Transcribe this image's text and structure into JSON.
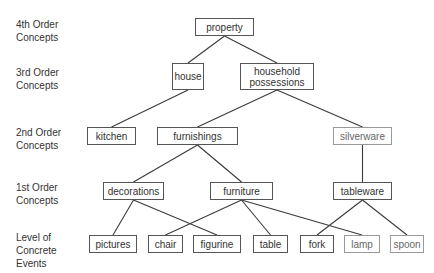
{
  "levels": [
    {
      "id": "L4",
      "label": "4th Order\nConcepts",
      "top": 18
    },
    {
      "id": "L3",
      "label": "3rd Order\nConcepts",
      "top": 66
    },
    {
      "id": "L2",
      "label": "2nd Order\nConcepts",
      "top": 126
    },
    {
      "id": "L1",
      "label": "1st Order\nConcepts",
      "top": 181
    },
    {
      "id": "L0",
      "label": "Level of\nConcrete\nEvents",
      "top": 231
    }
  ],
  "nodes": {
    "property": {
      "label": "property",
      "x": 195,
      "y": 18,
      "w": 59,
      "h": 18
    },
    "house": {
      "label": "house",
      "x": 172,
      "y": 63,
      "w": 32,
      "h": 27
    },
    "household_possessions": {
      "label": "household\npossessions",
      "x": 240,
      "y": 63,
      "w": 74,
      "h": 27
    },
    "kitchen": {
      "label": "kitchen",
      "x": 87,
      "y": 127,
      "w": 49,
      "h": 18
    },
    "furnishings": {
      "label": "furnishings",
      "x": 157,
      "y": 127,
      "w": 81,
      "h": 18
    },
    "silverware": {
      "label": "silverware",
      "x": 333,
      "y": 127,
      "w": 59,
      "h": 18
    },
    "decorations": {
      "label": "decorations",
      "x": 103,
      "y": 182,
      "w": 61,
      "h": 18
    },
    "furniture": {
      "label": "furniture",
      "x": 210,
      "y": 182,
      "w": 63,
      "h": 18
    },
    "tableware": {
      "label": "tableware",
      "x": 333,
      "y": 182,
      "w": 59,
      "h": 18
    },
    "pictures": {
      "label": "pictures",
      "x": 89,
      "y": 235,
      "w": 48,
      "h": 18
    },
    "chair": {
      "label": "chair",
      "x": 148,
      "y": 235,
      "w": 35,
      "h": 18
    },
    "figurine": {
      "label": "figurine",
      "x": 193,
      "y": 235,
      "w": 48,
      "h": 18
    },
    "table": {
      "label": "table",
      "x": 253,
      "y": 235,
      "w": 35,
      "h": 18
    },
    "fork": {
      "label": "fork",
      "x": 300,
      "y": 235,
      "w": 34,
      "h": 18
    },
    "lamp": {
      "label": "lamp",
      "x": 344,
      "y": 235,
      "w": 36,
      "h": 18
    },
    "spoon": {
      "label": "spoon",
      "x": 390,
      "y": 235,
      "w": 34,
      "h": 18
    }
  },
  "edges": [
    [
      "property",
      "house"
    ],
    [
      "property",
      "household_possessions"
    ],
    [
      "house",
      "kitchen"
    ],
    [
      "household_possessions",
      "furnishings"
    ],
    [
      "household_possessions",
      "silverware"
    ],
    [
      "furnishings",
      "decorations"
    ],
    [
      "furnishings",
      "furniture"
    ],
    [
      "silverware",
      "tableware"
    ],
    [
      "decorations",
      "pictures"
    ],
    [
      "decorations",
      "figurine"
    ],
    [
      "furniture",
      "chair"
    ],
    [
      "furniture",
      "table"
    ],
    [
      "furniture",
      "lamp"
    ],
    [
      "tableware",
      "fork"
    ],
    [
      "tableware",
      "spoon"
    ]
  ]
}
